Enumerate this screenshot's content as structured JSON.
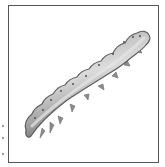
{
  "image": {
    "subject": "caterpillar larva illustration",
    "frame_color": "#555555",
    "body_colors": {
      "light": "#d8d8d8",
      "mid": "#a8a8a8",
      "dark": "#6e6e6e"
    },
    "spiracle_count": 11
  }
}
